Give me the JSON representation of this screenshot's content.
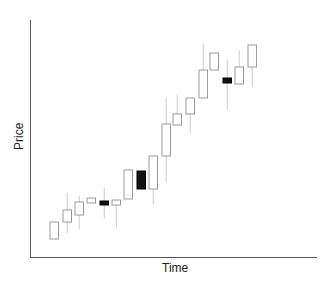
{
  "chart_data": {
    "type": "candlestick",
    "title": "",
    "xlabel": "Time",
    "ylabel": "Price",
    "grid": false,
    "legend": null,
    "ticks": "none",
    "colors": {
      "up_fill": "#ffffff",
      "up_stroke": "#999999",
      "down_fill": "#111111",
      "wick": "#cccccc",
      "axis": "#555555"
    },
    "candles": [
      {
        "t": 1,
        "open": 239,
        "close": 222,
        "high": 222,
        "low": 239,
        "dir": "up"
      },
      {
        "t": 2,
        "open": 222,
        "close": 210,
        "high": 193,
        "low": 233,
        "dir": "up"
      },
      {
        "t": 3,
        "open": 215,
        "close": 202,
        "high": 196,
        "low": 229,
        "dir": "up"
      },
      {
        "t": 4,
        "open": 203,
        "close": 198,
        "high": 198,
        "low": 203,
        "dir": "up"
      },
      {
        "t": 5,
        "open": 201,
        "close": 205,
        "high": 188,
        "low": 219,
        "dir": "down"
      },
      {
        "t": 6,
        "open": 205,
        "close": 200,
        "high": 200,
        "low": 228,
        "dir": "up"
      },
      {
        "t": 7,
        "open": 199,
        "close": 170,
        "high": 170,
        "low": 199,
        "dir": "up"
      },
      {
        "t": 8,
        "open": 171,
        "close": 189,
        "high": 171,
        "low": 189,
        "dir": "down"
      },
      {
        "t": 9,
        "open": 189,
        "close": 156,
        "high": 156,
        "low": 204,
        "dir": "up"
      },
      {
        "t": 10,
        "open": 156,
        "close": 124,
        "high": 98,
        "low": 182,
        "dir": "up"
      },
      {
        "t": 11,
        "open": 125,
        "close": 114,
        "high": 95,
        "low": 125,
        "dir": "up"
      },
      {
        "t": 12,
        "open": 114,
        "close": 98,
        "high": 98,
        "low": 133,
        "dir": "up"
      },
      {
        "t": 13,
        "open": 98,
        "close": 70,
        "high": 44,
        "low": 98,
        "dir": "up"
      },
      {
        "t": 14,
        "open": 70,
        "close": 53,
        "high": 53,
        "low": 70,
        "dir": "up"
      },
      {
        "t": 15,
        "open": 78,
        "close": 83,
        "high": 60,
        "low": 110,
        "dir": "down"
      },
      {
        "t": 16,
        "open": 84,
        "close": 67,
        "high": 50,
        "low": 84,
        "dir": "up"
      },
      {
        "t": 17,
        "open": 67,
        "close": 45,
        "high": 45,
        "low": 87,
        "dir": "up"
      }
    ]
  }
}
